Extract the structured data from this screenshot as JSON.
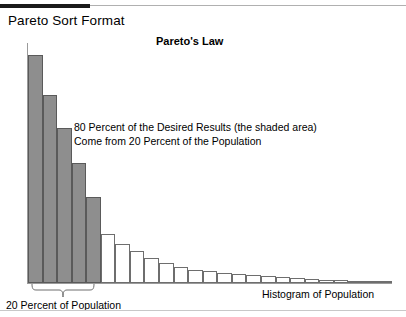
{
  "page": {
    "title": "Pareto Sort Format"
  },
  "chart": {
    "title": "Pareto's Law",
    "annotation_line1": "80 Percent of the Desired Results (the shaded area)",
    "annotation_line2": "Come from 20 Percent of the Population",
    "label_left": "20 Percent of Population",
    "label_right": "Histogram of Population",
    "colors": {
      "shaded_fill": "#8e8e8e",
      "bar_outline": "#666666",
      "axis": "#9a9a9a",
      "rule_thick": "#1a1a1a",
      "rule_thin": "#b0b0b0"
    }
  },
  "chart_data": {
    "type": "bar",
    "title": "Pareto's Law",
    "xlabel": "Histogram of Population",
    "ylabel": "",
    "grid": false,
    "legend": false,
    "baseline_y_px": 283,
    "categories": [
      "1",
      "2",
      "3",
      "4",
      "5",
      "6",
      "7",
      "8",
      "9",
      "10",
      "11",
      "12",
      "13",
      "14",
      "15",
      "16",
      "17",
      "18",
      "19",
      "20",
      "21",
      "22",
      "23",
      "24",
      "25"
    ],
    "values": [
      238,
      196,
      161,
      125,
      90,
      51,
      41,
      33,
      26,
      21,
      17,
      14,
      12,
      10,
      9,
      8,
      7,
      6,
      5,
      4,
      3,
      3,
      2,
      2,
      2
    ],
    "shaded_count": 5,
    "shaded_note": "first 5 bars are shaded gray = 20 percent of the population yielding 80 percent of results",
    "ylim": [
      0,
      250
    ],
    "annotations": [
      "80 Percent of the Desired Results (the shaded area)",
      "Come from 20 Percent of the Population",
      "20 Percent of Population",
      "Histogram of Population"
    ]
  }
}
